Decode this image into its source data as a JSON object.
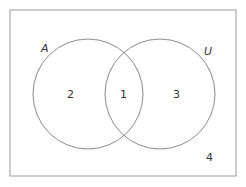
{
  "diagram": {
    "type": "venn",
    "colors": {
      "stroke": "#8a8a8a",
      "frame": "#9a9a9a",
      "text": "#333333",
      "background": "#ffffff"
    },
    "set_labels": {
      "left": "A",
      "universe": "U"
    },
    "regions": {
      "left_only": "2",
      "intersection": "1",
      "right_only": "3",
      "outside": "4"
    }
  }
}
